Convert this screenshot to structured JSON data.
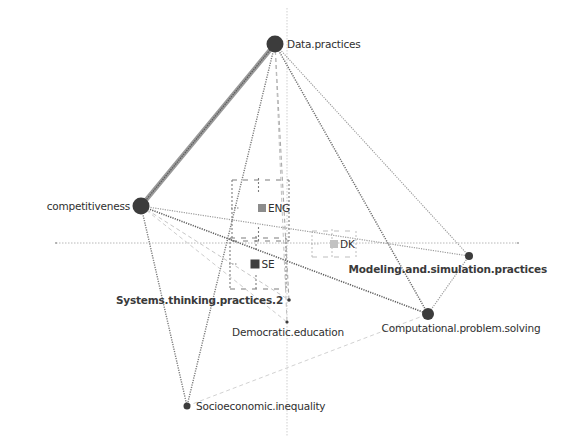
{
  "diagram": {
    "type": "multiple-factor-analysis-biplot",
    "canvas": {
      "width": 575,
      "height": 444
    },
    "axes": {
      "horizontal": {
        "y": 243,
        "x1": 56,
        "x2": 518,
        "color": "#b8b8b8"
      },
      "vertical": {
        "x": 287,
        "y1": 8,
        "y2": 436,
        "color": "#cfcfcf"
      }
    },
    "colors": {
      "node": "#3c3c3c",
      "edge_dark": "#6b6b6b",
      "edge_mid": "#8e8e8e",
      "edge_light": "#c4c4c4",
      "text": "#2f2f2f",
      "group_dark": "#4a4a4a",
      "group_light": "#bdbdbd"
    },
    "nodes": [
      {
        "id": "data",
        "label": "Data.practices",
        "x": 275,
        "y": 44,
        "r": 8.5,
        "label_dx": 12,
        "label_dy": 4,
        "anchor": "start",
        "bold": false
      },
      {
        "id": "comp",
        "label": "competitiveness",
        "x": 141,
        "y": 206,
        "r": 8.5,
        "label_dx": -11,
        "label_dy": 4,
        "anchor": "end",
        "bold": false
      },
      {
        "id": "model",
        "label": "Modeling.and.simulation.practices",
        "x": 469,
        "y": 256,
        "r": 4,
        "label_dx": 12,
        "label_dy": 17,
        "anchor": "end",
        "bold": true,
        "label_x": 547
      },
      {
        "id": "cps",
        "label": "Computational.problem.solving",
        "x": 428,
        "y": 314,
        "r": 6,
        "label_dx": 0,
        "label_dy": 18,
        "anchor": "middle",
        "bold": false,
        "label_x": 461
      },
      {
        "id": "sys",
        "label": "Systems.thinking.practices.2",
        "x": 289,
        "y": 300,
        "r": 1.8,
        "label_dx": -6,
        "label_dy": 4,
        "anchor": "end",
        "bold": true
      },
      {
        "id": "demo",
        "label": "Democratic.education",
        "x": 287,
        "y": 322,
        "r": 1.6,
        "label_dx": 0,
        "label_dy": 14,
        "anchor": "middle",
        "bold": false,
        "label_x": 288
      },
      {
        "id": "socio",
        "label": "Socioeconomic.inequality",
        "x": 187,
        "y": 406,
        "r": 3.5,
        "label_dx": 9,
        "label_dy": 4,
        "anchor": "start",
        "bold": false
      }
    ],
    "edges": [
      {
        "from": "data",
        "to": "comp",
        "width": 4.5,
        "style": "solid",
        "color": "#707070"
      },
      {
        "from": "data",
        "to": "socio",
        "width": 1.4,
        "style": "dotted",
        "color": "#7a7a7a"
      },
      {
        "from": "data",
        "to": "sys",
        "width": 1.1,
        "style": "dashed",
        "color": "#a9a9a9"
      },
      {
        "from": "data",
        "to": "demo",
        "width": 1.0,
        "style": "dashed",
        "color": "#c0c0c0"
      },
      {
        "from": "data",
        "to": "cps",
        "width": 1.5,
        "style": "dotted",
        "color": "#6e6e6e"
      },
      {
        "from": "data",
        "to": "model",
        "width": 1.1,
        "style": "dotted",
        "color": "#9a9a9a"
      },
      {
        "from": "comp",
        "to": "socio",
        "width": 1.4,
        "style": "dotted",
        "color": "#7a7a7a"
      },
      {
        "from": "comp",
        "to": "cps",
        "width": 1.6,
        "style": "dotted",
        "color": "#5e5e5e"
      },
      {
        "from": "comp",
        "to": "model",
        "width": 1.2,
        "style": "dotted",
        "color": "#9c9c9c"
      },
      {
        "from": "comp",
        "to": "sys",
        "width": 1.0,
        "style": "dashed",
        "color": "#c6c6c6"
      },
      {
        "from": "comp",
        "to": "demo",
        "width": 1.0,
        "style": "dashed",
        "color": "#cdcdcd"
      },
      {
        "from": "model",
        "to": "cps",
        "width": 1.2,
        "style": "dotted",
        "color": "#9a9a9a"
      },
      {
        "from": "socio",
        "to": "cps",
        "width": 1.0,
        "style": "dashed",
        "color": "#d2d2d2"
      }
    ],
    "groups": [
      {
        "id": "ENG",
        "label": "ENG",
        "x": 262,
        "y": 208,
        "size": 8,
        "color": "#8c8c8c",
        "frame": {
          "x1": 232,
          "y1": 180,
          "x2": 289,
          "y2": 241
        }
      },
      {
        "id": "SE",
        "label": "SE",
        "x": 255,
        "y": 264,
        "size": 9,
        "color": "#3e3e3e",
        "frame": {
          "x1": 230,
          "y1": 238,
          "x2": 286,
          "y2": 289
        }
      },
      {
        "id": "DK",
        "label": "DK",
        "x": 334,
        "y": 244,
        "size": 8,
        "color": "#c2c2c2",
        "frame": {
          "x1": 312,
          "y1": 231,
          "x2": 356,
          "y2": 257
        }
      }
    ]
  }
}
